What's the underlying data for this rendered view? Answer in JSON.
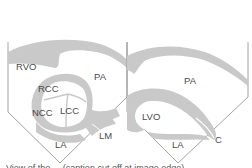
{
  "figure": {
    "colors": {
      "background": "#ffffff",
      "tissue": "#c9c9c9",
      "outline": "#8a8a8a",
      "label": "#4a4a4a"
    },
    "left_panel": {
      "labels": {
        "rvo": "RVO",
        "pa": "PA",
        "rcc": "RCC",
        "ncc": "NCC",
        "lcc": "LCC",
        "lm": "LM",
        "la": "LA"
      }
    },
    "right_panel": {
      "labels": {
        "pa": "PA",
        "lvo": "LVO",
        "la": "LA",
        "c": "C"
      }
    },
    "caption": {
      "text": "View of the ... (caption cut off at image edge)"
    }
  }
}
